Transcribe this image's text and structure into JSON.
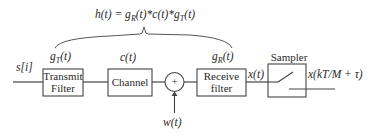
{
  "diagram": {
    "equation": "h(t) = gR(t)*c(t)*gT(t)",
    "equation_parts": {
      "lhs": "h(t) = g",
      "r_sub": "R",
      "mid": "(t)*c(t)*g",
      "t_sub": "T",
      "end": "(t)"
    },
    "input_label": "s[i]",
    "blocks": [
      {
        "id": "transmit",
        "label_line1": "Transmit",
        "label_line2": "Filter",
        "response": "g",
        "response_sub": "T",
        "response_arg": "(t)"
      },
      {
        "id": "channel",
        "label_line1": "Channel",
        "response": "c(t)"
      },
      {
        "id": "adder",
        "symbol": "+",
        "noise_label": "w(t)"
      },
      {
        "id": "receive",
        "label_line1": "Receive",
        "label_line2": "filter",
        "response": "g",
        "response_sub": "R",
        "response_arg": "(t)"
      },
      {
        "id": "sampler",
        "label": "Sampler"
      }
    ],
    "intermediate_label": "x(t)",
    "output_label": "x(kT/M + τ)",
    "colors": {
      "line": "#444444",
      "text": "#2a2a2a",
      "background": "#ffffff"
    }
  }
}
